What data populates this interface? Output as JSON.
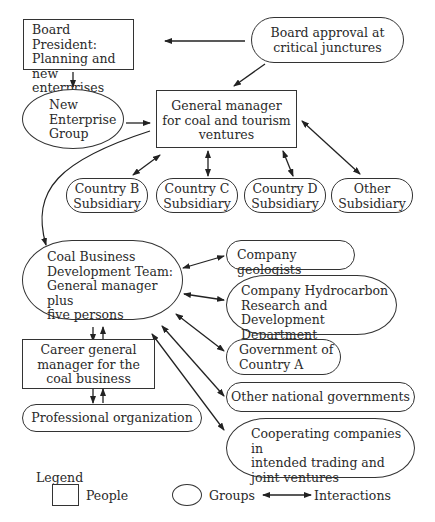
{
  "nodes": {
    "board_president": {
      "type": "people",
      "label": "Board President:\nPlanning and\nnew enterprises"
    },
    "board_approval": {
      "type": "group",
      "label": "Board approval at\ncritical junctures"
    },
    "new_enterprise_group": {
      "type": "group",
      "label": "New\nEnterprise\nGroup"
    },
    "general_manager": {
      "type": "people",
      "label": "General manager\nfor coal and tourism\nventures"
    },
    "country_b": {
      "type": "group",
      "label": "Country B\nSubsidiary"
    },
    "country_c": {
      "type": "group",
      "label": "Country C\nSubsidiary"
    },
    "country_d": {
      "type": "group",
      "label": "Country D\nSubsidiary"
    },
    "other_subsidiary": {
      "type": "group",
      "label": "Other\nSubsidiary"
    },
    "coal_team": {
      "type": "group",
      "label": "Coal Business\nDevelopment Team:\nGeneral manager plus\nfive persons"
    },
    "career_gm": {
      "type": "people",
      "label": "Career general\nmanager for the\ncoal business"
    },
    "professional_org": {
      "type": "group",
      "label": "Professional organization"
    },
    "geologists": {
      "type": "group",
      "label": "Company geologists"
    },
    "hydrocarbon": {
      "type": "group",
      "label": "Company Hydrocarbon\nResearch and Development\nDepartment"
    },
    "gov_a": {
      "type": "group",
      "label": "Government of\nCountry A"
    },
    "other_govs": {
      "type": "group",
      "label": "Other national governments"
    },
    "cooperating": {
      "type": "group",
      "label": "Cooperating companies in\nintended trading and\njoint ventures"
    }
  },
  "edges": [
    {
      "from": "board_approval",
      "to": "board_president",
      "kind": "one-way"
    },
    {
      "from": "board_approval",
      "to": "general_manager",
      "kind": "one-way"
    },
    {
      "from": "board_president",
      "to": "new_enterprise_group",
      "kind": "one-way"
    },
    {
      "from": "new_enterprise_group",
      "to": "general_manager",
      "kind": "one-way"
    },
    {
      "from": "general_manager",
      "to": "country_b",
      "kind": "interaction"
    },
    {
      "from": "general_manager",
      "to": "country_c",
      "kind": "interaction"
    },
    {
      "from": "general_manager",
      "to": "country_d",
      "kind": "interaction"
    },
    {
      "from": "general_manager",
      "to": "other_subsidiary",
      "kind": "interaction"
    },
    {
      "from": "general_manager",
      "to": "coal_team",
      "kind": "one-way-curved"
    },
    {
      "from": "coal_team",
      "to": "geologists",
      "kind": "interaction"
    },
    {
      "from": "coal_team",
      "to": "hydrocarbon",
      "kind": "interaction"
    },
    {
      "from": "coal_team",
      "to": "gov_a",
      "kind": "interaction"
    },
    {
      "from": "coal_team",
      "to": "other_govs",
      "kind": "interaction"
    },
    {
      "from": "coal_team",
      "to": "cooperating",
      "kind": "interaction"
    },
    {
      "from": "coal_team",
      "to": "career_gm",
      "kind": "interaction"
    },
    {
      "from": "career_gm",
      "to": "professional_org",
      "kind": "interaction"
    }
  ],
  "legend": {
    "title": "Legend",
    "people": "People",
    "groups": "Groups",
    "interactions": "Interactions"
  }
}
